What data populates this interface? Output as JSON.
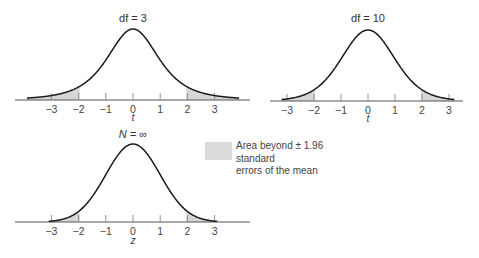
{
  "chart_data": [
    {
      "type": "area",
      "title": "df = 3",
      "distribution": "Student's t",
      "df": 3,
      "xlabel": "t",
      "ylabel": "",
      "x_ticks": [
        -3,
        -2,
        -1,
        0,
        1,
        2,
        3
      ],
      "x_tick_labels": [
        "−3",
        "−2",
        "−1",
        "0",
        "1",
        "2",
        "3"
      ],
      "xlim": [
        -3.9,
        3.9
      ],
      "shaded_regions": [
        [
          -3.9,
          -1.96
        ],
        [
          1.96,
          3.9
        ]
      ],
      "grid": false
    },
    {
      "type": "area",
      "title": "df = 10",
      "distribution": "Student's t",
      "df": 10,
      "xlabel": "t",
      "ylabel": "",
      "x_ticks": [
        -3,
        -2,
        -1,
        0,
        1,
        2,
        3
      ],
      "x_tick_labels": [
        "−3",
        "−2",
        "−1",
        "0",
        "1",
        "2",
        "3"
      ],
      "xlim": [
        -3.2,
        3.2
      ],
      "shaded_regions": [
        [
          -3.2,
          -1.96
        ],
        [
          1.96,
          3.2
        ]
      ],
      "grid": false
    },
    {
      "type": "area",
      "title": "N = ∞",
      "distribution": "Normal (z)",
      "df": "infinity",
      "xlabel": "z",
      "ylabel": "",
      "x_ticks": [
        -3,
        -2,
        -1,
        0,
        1,
        2,
        3
      ],
      "x_tick_labels": [
        "−3",
        "−2",
        "−1",
        "0",
        "1",
        "2",
        "3"
      ],
      "xlim": [
        -3.1,
        3.1
      ],
      "shaded_regions": [
        [
          -3.1,
          -1.96
        ],
        [
          1.96,
          3.1
        ]
      ],
      "grid": false
    }
  ],
  "legend": {
    "line1": "Area beyond ± 1.96 standard",
    "line2": "errors of the mean",
    "swatch_color": "#dcdcdc"
  },
  "panels": {
    "p1": {
      "title": "df = 3",
      "xlabel": "t"
    },
    "p2": {
      "title": "df = 10",
      "xlabel": "t"
    },
    "p3": {
      "title": "N = ∞",
      "xlabel": "z"
    }
  },
  "tick_labels": [
    "−3",
    "−2",
    "−1",
    "0",
    "1",
    "2",
    "3"
  ],
  "colors": {
    "curve": "#1a1a1a",
    "shade": "#d6d6d6",
    "axis": "#555555"
  }
}
